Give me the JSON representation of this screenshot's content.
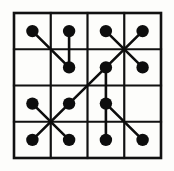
{
  "figure": {
    "background_color": "#fdfdfb",
    "ink_color": "#0d0d0d",
    "grid_color": "#111111"
  },
  "grid": {
    "rows": 4,
    "columns": 4,
    "x_left": 14,
    "y_top": 13,
    "x_right": 161,
    "y_bottom": 158,
    "cell_width": 36.75,
    "cell_height": 36.25,
    "border_width": 2.6,
    "line_width": 2.2,
    "vertical_x": [
      14,
      50.75,
      87.5,
      124.25,
      161
    ],
    "horizontal_y": [
      13,
      49.25,
      85.5,
      121.75,
      158
    ]
  },
  "dots": {
    "radius": 6.2,
    "count": 14,
    "points": [
      {
        "id": "r1c1",
        "row": 1,
        "col": 1,
        "x": 32.4,
        "y": 31.1
      },
      {
        "id": "r1c2",
        "row": 1,
        "col": 2,
        "x": 69.1,
        "y": 31.1
      },
      {
        "id": "r1c3",
        "row": 1,
        "col": 3,
        "x": 105.9,
        "y": 31.1
      },
      {
        "id": "r1c4",
        "row": 1,
        "col": 4,
        "x": 142.6,
        "y": 31.1
      },
      {
        "id": "r2c2",
        "row": 2,
        "col": 2,
        "x": 69.1,
        "y": 67.4
      },
      {
        "id": "r2c3",
        "row": 2,
        "col": 3,
        "x": 105.9,
        "y": 67.4
      },
      {
        "id": "r2c4",
        "row": 2,
        "col": 4,
        "x": 142.6,
        "y": 67.4
      },
      {
        "id": "r3c1",
        "row": 3,
        "col": 1,
        "x": 32.4,
        "y": 103.6
      },
      {
        "id": "r3c2",
        "row": 3,
        "col": 2,
        "x": 69.1,
        "y": 103.6
      },
      {
        "id": "r3c3",
        "row": 3,
        "col": 3,
        "x": 105.9,
        "y": 103.6
      },
      {
        "id": "r4c1",
        "row": 4,
        "col": 1,
        "x": 32.4,
        "y": 139.9
      },
      {
        "id": "r4c2",
        "row": 4,
        "col": 2,
        "x": 69.1,
        "y": 139.9
      },
      {
        "id": "r4c3",
        "row": 4,
        "col": 3,
        "x": 105.9,
        "y": 139.9
      },
      {
        "id": "r4c4",
        "row": 4,
        "col": 4,
        "x": 142.6,
        "y": 139.9
      }
    ]
  },
  "connections": {
    "stroke_width": 2.6,
    "count": 9,
    "segments": [
      {
        "id": "seg-1",
        "from": "r1c1",
        "to": "r2c2",
        "x1": 32.4,
        "y1": 31.1,
        "x2": 69.1,
        "y2": 67.4
      },
      {
        "id": "seg-2",
        "from": "r1c2",
        "to": "r2c2",
        "x1": 69.1,
        "y1": 31.1,
        "x2": 69.1,
        "y2": 67.4
      },
      {
        "id": "seg-3",
        "from": "r1c3",
        "to": "r2c4",
        "x1": 105.9,
        "y1": 31.1,
        "x2": 142.6,
        "y2": 67.4
      },
      {
        "id": "seg-4",
        "from": "r1c4",
        "to": "r2c3",
        "x1": 142.6,
        "y1": 31.1,
        "x2": 105.9,
        "y2": 67.4
      },
      {
        "id": "seg-5",
        "from": "r3c2",
        "to": "r2c3",
        "x1": 69.1,
        "y1": 103.6,
        "x2": 105.9,
        "y2": 67.4
      },
      {
        "id": "seg-6",
        "from": "r2c3",
        "to": "r3c3",
        "x1": 105.9,
        "y1": 67.4,
        "x2": 105.9,
        "y2": 103.6
      },
      {
        "id": "seg-7",
        "from": "r3c1",
        "to": "r4c2",
        "x1": 32.4,
        "y1": 103.6,
        "x2": 69.1,
        "y2": 139.9
      },
      {
        "id": "seg-8",
        "from": "r3c2",
        "to": "r4c1",
        "x1": 69.1,
        "y1": 103.6,
        "x2": 32.4,
        "y2": 139.9
      },
      {
        "id": "seg-9",
        "from": "r3c3",
        "to": "r4c4",
        "x1": 105.9,
        "y1": 103.6,
        "x2": 142.6,
        "y2": 139.9
      },
      {
        "id": "seg-10",
        "from": "r3c3",
        "to": "r4c3",
        "x1": 105.9,
        "y1": 103.6,
        "x2": 105.9,
        "y2": 139.9
      }
    ]
  }
}
